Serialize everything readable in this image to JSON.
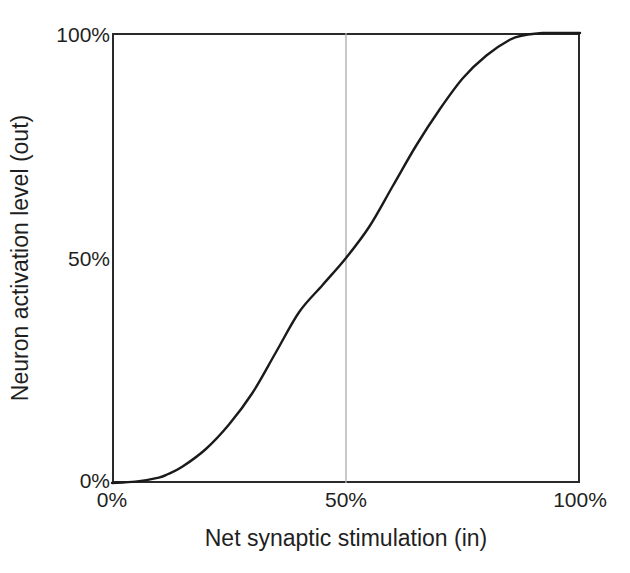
{
  "chart_data": {
    "type": "line",
    "title": "",
    "xlabel": "Net synaptic stimulation (in)",
    "ylabel": "Neuron activation level (out)",
    "xlim": [
      0,
      100
    ],
    "ylim": [
      0,
      100
    ],
    "xticks": [
      {
        "value": 0,
        "label": "0%"
      },
      {
        "value": 50,
        "label": "50%"
      },
      {
        "value": 100,
        "label": "100%"
      }
    ],
    "yticks": [
      {
        "value": 0,
        "label": "0%"
      },
      {
        "value": 50,
        "label": "50%"
      },
      {
        "value": 100,
        "label": "100%"
      }
    ],
    "grid": {
      "vertical_gridlines": [
        50
      ],
      "horizontal_gridlines": [],
      "color": "#b0b0b0"
    },
    "legend": null,
    "series": [
      {
        "name": "Sigmoid activation",
        "color": "#1a1a1a",
        "line_width": 2,
        "x": [
          0,
          5,
          10,
          12,
          15,
          20,
          25,
          30,
          35,
          40,
          45,
          50,
          55,
          60,
          65,
          70,
          75,
          80,
          85,
          88,
          92,
          96,
          100
        ],
        "y": [
          0,
          0.3,
          1.2,
          2,
          3.6,
          7.5,
          13,
          20,
          29,
          38,
          44,
          50,
          57,
          66,
          75,
          83,
          90,
          95,
          98.5,
          99.5,
          100,
          100,
          100
        ]
      }
    ],
    "annotations": []
  },
  "axes": {
    "x_title": "Net synaptic stimulation (in)",
    "y_title": "Neuron activation level (out)",
    "x_tick_labels": [
      "0%",
      "50%",
      "100%"
    ],
    "y_tick_labels": [
      "0%",
      "50%",
      "100%"
    ]
  },
  "colors": {
    "curve": "#1a1a1a",
    "frame": "#2a2a2a",
    "gridline": "#b0b0b0",
    "background": "#ffffff",
    "text": "#1f1f1f"
  }
}
